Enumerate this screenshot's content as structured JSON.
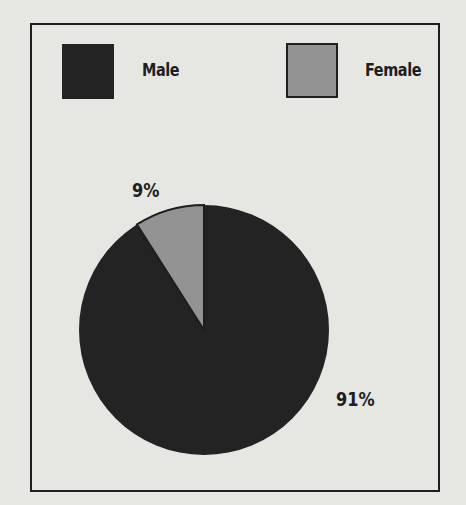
{
  "chart_data": {
    "type": "pie",
    "title": "",
    "categories": [
      "Male",
      "Female"
    ],
    "values": [
      91,
      9
    ],
    "labels": [
      "91%",
      "9%"
    ],
    "colors": [
      "#232323",
      "#939393"
    ],
    "legend": {
      "position": "top",
      "entries": [
        {
          "label": "Male",
          "color": "#232323"
        },
        {
          "label": "Female",
          "color": "#939393"
        }
      ]
    }
  },
  "legend": {
    "male_label": "Male",
    "female_label": "Female"
  },
  "slices": {
    "male_pct": "91%",
    "female_pct": "9%"
  }
}
